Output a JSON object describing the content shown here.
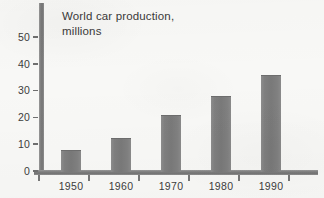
{
  "chart_data": {
    "type": "bar",
    "title": "World car production,\nmillions",
    "title_lines": [
      "World car production,",
      "millions"
    ],
    "categories": [
      "1950",
      "1960",
      "1970",
      "1980",
      "1990"
    ],
    "values": [
      7.8,
      12.2,
      21.0,
      28.0,
      36.0
    ],
    "xlabel": "",
    "ylabel": "",
    "ylim": [
      0,
      57
    ],
    "ytick_labels": [
      "0",
      "10",
      "20",
      "30",
      "40",
      "50"
    ],
    "ytick_values": [
      0,
      10,
      20,
      30,
      40,
      50
    ],
    "grid": false,
    "legend": null,
    "series": [
      {
        "name": "World car production (millions)",
        "values": [
          7.8,
          12.2,
          21.0,
          28.0,
          36.0
        ]
      }
    ]
  },
  "style": {
    "background_color": "#f8f8f6",
    "bar_color": "#7f7f7f",
    "axis_color": "#7d7d7d",
    "text_color": "#3a3a3a"
  }
}
